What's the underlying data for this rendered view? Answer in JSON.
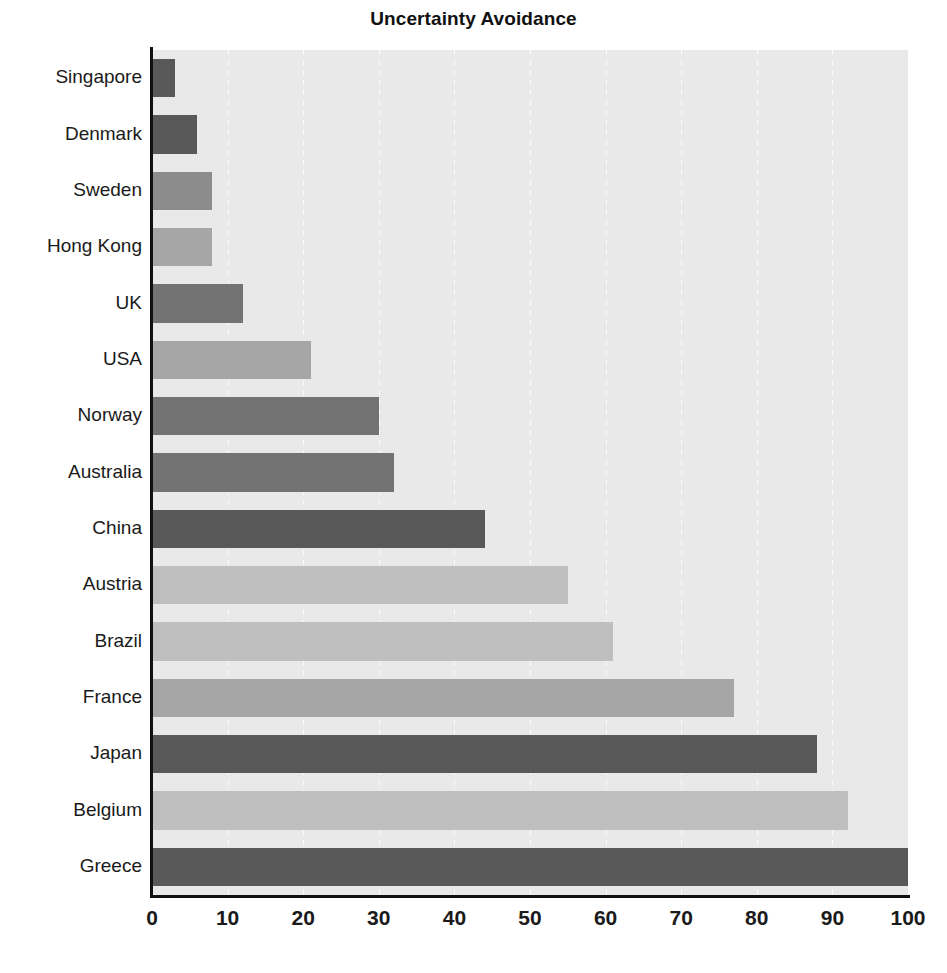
{
  "chart_data": {
    "type": "bar",
    "orientation": "horizontal",
    "title": "Uncertainty Avoidance",
    "xlabel": "",
    "ylabel": "",
    "xlim": [
      0,
      100
    ],
    "xticks": [
      0,
      10,
      20,
      30,
      40,
      50,
      60,
      70,
      80,
      90,
      100
    ],
    "grid": true,
    "grid_axis": "x",
    "legend": false,
    "categories": [
      "Singapore",
      "Denmark",
      "Sweden",
      "Hong Kong",
      "UK",
      "USA",
      "Norway",
      "Australia",
      "China",
      "Austria",
      "Brazil",
      "France",
      "Japan",
      "Belgium",
      "Greece"
    ],
    "values": [
      3,
      6,
      8,
      8,
      12,
      21,
      30,
      32,
      44,
      55,
      61,
      77,
      88,
      92,
      100
    ],
    "bar_colors": [
      "#595959",
      "#595959",
      "#8c8c8c",
      "#a6a6a6",
      "#737373",
      "#a6a6a6",
      "#737373",
      "#737373",
      "#595959",
      "#bfbfbf",
      "#bfbfbf",
      "#a6a6a6",
      "#595959",
      "#bfbfbf",
      "#595959"
    ]
  },
  "style": {
    "plot_background": "#e9e9e9",
    "axis_color": "#111111",
    "gridline_color": "#fbfbfb",
    "text_color": "#1a1a1a",
    "page_background": "#ffffff"
  }
}
